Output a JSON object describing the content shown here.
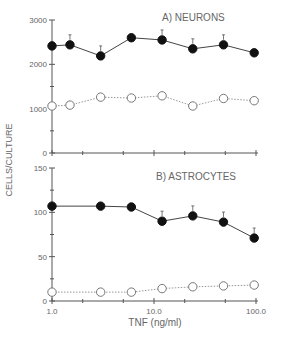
{
  "ylabel": "CELLS/CULTURE",
  "xlabel": "TNF (ng/ml)",
  "chart_data": [
    {
      "type": "line",
      "title": "A) NEURONS",
      "x": [
        1.0,
        1.5,
        3,
        6,
        12,
        24,
        48,
        96
      ],
      "series": [
        {
          "name": "filled",
          "marker": "filled-circle",
          "style": "solid",
          "values": [
            2415,
            2440,
            2190,
            2600,
            2550,
            2350,
            2440,
            2260
          ],
          "sig": [
            false,
            true,
            true,
            false,
            true,
            true,
            true,
            false
          ]
        },
        {
          "name": "open",
          "marker": "open-circle",
          "style": "dotted",
          "values": [
            1060,
            1080,
            1260,
            1240,
            1290,
            1060,
            1230,
            1180
          ]
        }
      ],
      "ylim": [
        0,
        3000
      ],
      "yticks": [
        0,
        1000,
        2000,
        3000
      ],
      "xscale": "log",
      "xlim": [
        1.0,
        100.0
      ]
    },
    {
      "type": "line",
      "title": "B) ASTROCYTES",
      "x": [
        1.0,
        3,
        6,
        12,
        24,
        48,
        96
      ],
      "series": [
        {
          "name": "filled",
          "marker": "filled-circle",
          "style": "solid",
          "values": [
            107,
            107,
            106,
            90,
            96,
            89,
            71
          ],
          "sig": [
            false,
            false,
            false,
            true,
            true,
            true,
            true
          ]
        },
        {
          "name": "open",
          "marker": "open-circle",
          "style": "dotted",
          "values": [
            10,
            10,
            10,
            14,
            16,
            17,
            18
          ]
        }
      ],
      "ylim": [
        0,
        150
      ],
      "yticks": [
        0,
        50,
        100,
        150
      ],
      "xscale": "log",
      "xlim": [
        1.0,
        100.0
      ],
      "xticklabels": [
        "1.0",
        "10.0",
        "100.0"
      ]
    }
  ]
}
